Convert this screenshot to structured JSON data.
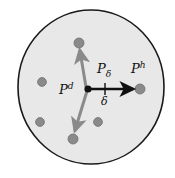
{
  "figure": {
    "kind": "geometric-diagram",
    "width": 175,
    "height": 178,
    "background_color": "#ffffff",
    "region": {
      "name": "neighborhood-disc",
      "shape": "circle",
      "center_x": 91,
      "center_y": 87,
      "radius_x": 73,
      "radius_y": 77,
      "fill_color": "#e8e8e8",
      "stroke_color": "#1a1a1a",
      "stroke_width": 1.6
    },
    "points": [
      {
        "id": "pd",
        "name": "current-point-pd",
        "x": 88,
        "y": 89,
        "radius": 3.6,
        "color": "#1a1a1a",
        "label": "P",
        "superscript": "d",
        "subscript": ""
      },
      {
        "id": "ph",
        "name": "target-point-ph",
        "x": 140,
        "y": 89,
        "radius": 5.0,
        "color": "#8a8a8a",
        "label": "P",
        "superscript": "h",
        "subscript": ""
      },
      {
        "id": "pup",
        "name": "candidate-point-upper",
        "x": 79,
        "y": 43,
        "radius": 5.0,
        "color": "#8a8a8a",
        "label": "",
        "superscript": "",
        "subscript": ""
      },
      {
        "id": "pdn",
        "name": "candidate-point-lower",
        "x": 73,
        "y": 139,
        "radius": 5.0,
        "color": "#8a8a8a",
        "label": "",
        "superscript": "",
        "subscript": ""
      }
    ],
    "scatter_dots": [
      {
        "name": "scatter-dot-left",
        "x": 42,
        "y": 82,
        "radius": 4.4,
        "color": "#8a8a8a"
      },
      {
        "name": "scatter-dot-lower-left",
        "x": 40,
        "y": 122,
        "radius": 4.4,
        "color": "#8a8a8a"
      },
      {
        "name": "scatter-dot-lower-mid",
        "x": 98,
        "y": 122,
        "radius": 4.4,
        "color": "#8a8a8a"
      }
    ],
    "arrows": [
      {
        "id": "arrow-main",
        "name": "displacement-arrow-pd-to-ph",
        "from_x": 88,
        "from_y": 89,
        "to_x": 140,
        "to_y": 89,
        "color": "#111111",
        "stroke_width": 2.6,
        "head_length": 12,
        "head_width": 9
      },
      {
        "id": "arrow-up",
        "name": "alternative-arrow-upper",
        "from_x": 86,
        "from_y": 87,
        "to_x": 79,
        "to_y": 45,
        "color": "#8a8a8a",
        "stroke_width": 3.0,
        "head_length": 13,
        "head_width": 10
      },
      {
        "id": "arrow-down",
        "name": "alternative-arrow-lower",
        "from_x": 87,
        "from_y": 91,
        "to_x": 74,
        "to_y": 136,
        "color": "#8a8a8a",
        "stroke_width": 3.0,
        "head_length": 13,
        "head_width": 10
      }
    ],
    "tick": {
      "name": "delta-step-tick",
      "x": 105,
      "y_top": 83,
      "y_bottom": 95,
      "color": "#111111",
      "stroke_width": 1.4
    },
    "labels": {
      "pd": {
        "base": "P",
        "sup": "d"
      },
      "p_delta": {
        "base": "P",
        "sub": "δ"
      },
      "ph": {
        "base": "P",
        "sup": "h"
      },
      "delta": {
        "base": "δ"
      }
    }
  }
}
